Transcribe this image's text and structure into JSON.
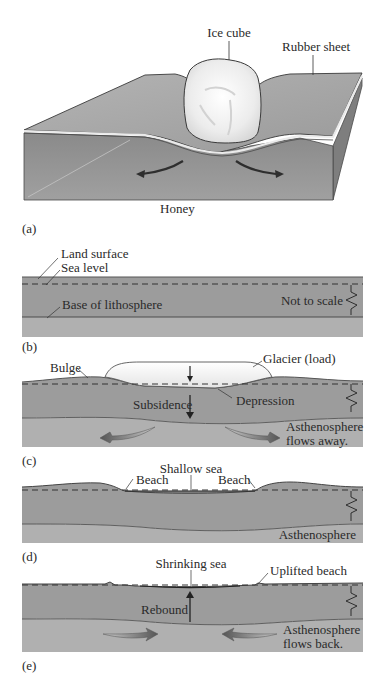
{
  "figure": {
    "panels": [
      {
        "id": "a",
        "tag": "(a)",
        "labels": {
          "ice_cube": "Ice cube",
          "rubber_sheet": "Rubber sheet",
          "honey": "Honey"
        }
      },
      {
        "id": "b",
        "tag": "(b)",
        "labels": {
          "land_surface": "Land surface",
          "sea_level": "Sea level",
          "base_of_lithosphere": "Base of lithosphere",
          "not_to_scale": "Not to scale"
        }
      },
      {
        "id": "c",
        "tag": "(c)",
        "labels": {
          "bulge": "Bulge",
          "glacier": "Glacier (load)",
          "subsidence": "Subsidence",
          "depression": "Depression",
          "asthenosphere_line1": "Asthenosphere",
          "asthenosphere_line2": "flows away."
        }
      },
      {
        "id": "d",
        "tag": "(d)",
        "labels": {
          "shallow_sea": "Shallow sea",
          "beach_left": "Beach",
          "beach_right": "Beach",
          "asthenosphere": "Asthenosphere"
        }
      },
      {
        "id": "e",
        "tag": "(e)",
        "labels": {
          "shrinking_sea": "Shrinking sea",
          "uplifted_beach": "Uplifted beach",
          "rebound": "Rebound",
          "asthenosphere_line1": "Asthenosphere",
          "asthenosphere_line2": "flows back."
        }
      }
    ],
    "colors": {
      "lithosphere": "#9a9a9a",
      "asthenosphere": "#adadad",
      "block_top": "#a6a6a6",
      "block_front": "#8f8f8f",
      "block_side": "#7c7c7c",
      "ice": "#f2f2f2",
      "outline": "#3a3a3a"
    }
  }
}
